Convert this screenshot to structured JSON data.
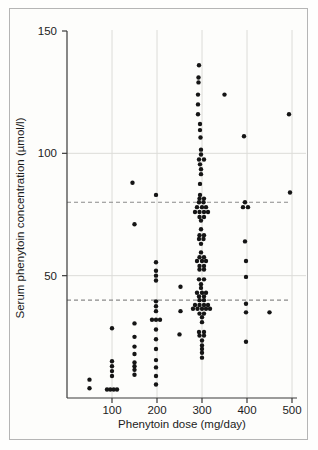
{
  "figure": {
    "background_color": "#fdfdfb",
    "frame_border_color": "#b5b5b5",
    "axis_color": "#3a3a3a",
    "gridline_color": "#dcdcd8",
    "reference_line_color": "#8a8a8a",
    "point_color": "#151515"
  },
  "chart_data": {
    "type": "scatter",
    "title": "",
    "xlabel": "Phenytoin dose (mg/day)",
    "ylabel": "Serum phenytoin concentration (µmol/l)",
    "xlim": [
      0,
      520
    ],
    "ylim": [
      0,
      150
    ],
    "x_ticks": [
      100,
      200,
      300,
      400,
      500
    ],
    "y_ticks": [
      50,
      100,
      150
    ],
    "grid": {
      "vertical_at_x_ticks": true,
      "horizontal_at_y": [
        50,
        100
      ]
    },
    "reference_lines": {
      "style": "dashed",
      "orientation": "horizontal",
      "values": [
        40,
        80
      ],
      "meaning": "therapeutic range shown by dashed lines"
    },
    "legend": null,
    "series": [
      {
        "name": "patients",
        "marker": "filled-circle",
        "points": [
          [
            50,
            7.5
          ],
          [
            50,
            4
          ],
          [
            100,
            28.5
          ],
          [
            100,
            15
          ],
          [
            100,
            13
          ],
          [
            100,
            11
          ],
          [
            100,
            9
          ],
          [
            100,
            3.5,
            -5
          ],
          [
            100,
            3.5,
            -1.7
          ],
          [
            100,
            3.5,
            1.7
          ],
          [
            100,
            3.5,
            5
          ],
          [
            150,
            88,
            -2
          ],
          [
            150,
            71
          ],
          [
            150,
            30.5
          ],
          [
            150,
            25
          ],
          [
            150,
            21
          ],
          [
            150,
            18
          ],
          [
            150,
            14.5
          ],
          [
            150,
            13
          ],
          [
            150,
            11.5
          ],
          [
            150,
            9.5
          ],
          [
            200,
            83,
            -1
          ],
          [
            200,
            55.5,
            -1
          ],
          [
            200,
            52,
            -1
          ],
          [
            200,
            50,
            -1
          ],
          [
            200,
            48,
            -1
          ],
          [
            200,
            39.5,
            -1
          ],
          [
            200,
            37.5,
            -1
          ],
          [
            200,
            35.5,
            -1
          ],
          [
            200,
            32,
            -5
          ],
          [
            200,
            32,
            -1
          ],
          [
            200,
            32,
            3
          ],
          [
            200,
            28,
            -1
          ],
          [
            200,
            24,
            -1
          ],
          [
            200,
            20,
            -1
          ],
          [
            200,
            15.5,
            -1
          ],
          [
            200,
            12.5,
            -1
          ],
          [
            200,
            9,
            -1
          ],
          [
            200,
            5.5,
            -1
          ],
          [
            250,
            45.5,
            1
          ],
          [
            250,
            35.5,
            1
          ],
          [
            250,
            26
          ],
          [
            300,
            136,
            -3
          ],
          [
            300,
            131,
            -3.5
          ],
          [
            300,
            129,
            -3.5
          ],
          [
            300,
            124,
            -4
          ],
          [
            300,
            120,
            -4
          ],
          [
            300,
            116,
            -4
          ],
          [
            300,
            112,
            -2
          ],
          [
            300,
            109.5,
            -2
          ],
          [
            300,
            106.5,
            -1.5
          ],
          [
            300,
            101.5,
            -1
          ],
          [
            300,
            99.5,
            -1
          ],
          [
            300,
            97.5,
            -3
          ],
          [
            300,
            97.5,
            2
          ],
          [
            300,
            95.5,
            -2
          ],
          [
            300,
            93.5,
            -1
          ],
          [
            300,
            91.5,
            -1
          ],
          [
            300,
            87.5,
            -2
          ],
          [
            300,
            83,
            -2
          ],
          [
            300,
            81.5,
            -2.5
          ],
          [
            300,
            81.5,
            2
          ],
          [
            300,
            80,
            -3
          ],
          [
            300,
            80,
            1.5
          ],
          [
            300,
            78,
            -5
          ],
          [
            300,
            78,
            0
          ],
          [
            300,
            78,
            4
          ],
          [
            300,
            76,
            -7
          ],
          [
            300,
            76,
            -2.5
          ],
          [
            300,
            76,
            2
          ],
          [
            300,
            76,
            6
          ],
          [
            300,
            74,
            -2.5
          ],
          [
            300,
            74,
            2
          ],
          [
            300,
            72.5,
            -1
          ],
          [
            300,
            69,
            -1
          ],
          [
            300,
            66.5,
            -2.5
          ],
          [
            300,
            66.5,
            2
          ],
          [
            300,
            65,
            -3
          ],
          [
            300,
            65,
            1.5
          ],
          [
            300,
            63,
            -1
          ],
          [
            300,
            59.5,
            -1
          ],
          [
            300,
            57.5,
            -2.5
          ],
          [
            300,
            57.5,
            2
          ],
          [
            300,
            56,
            -5
          ],
          [
            300,
            56,
            0
          ],
          [
            300,
            56,
            4
          ],
          [
            300,
            54,
            -2.5
          ],
          [
            300,
            54,
            2
          ],
          [
            300,
            52.5,
            -2.5
          ],
          [
            300,
            52.5,
            2
          ],
          [
            300,
            48.5,
            -3
          ],
          [
            300,
            48.5,
            2
          ],
          [
            300,
            46.5,
            -1
          ],
          [
            300,
            45,
            -1
          ],
          [
            300,
            43,
            -5
          ],
          [
            300,
            43,
            0
          ],
          [
            300,
            43,
            4
          ],
          [
            300,
            41.5,
            -3
          ],
          [
            300,
            41.5,
            2
          ],
          [
            300,
            40,
            -2.5
          ],
          [
            300,
            40,
            2
          ],
          [
            300,
            38,
            -7
          ],
          [
            300,
            38,
            -2.5
          ],
          [
            300,
            38,
            2
          ],
          [
            300,
            38,
            6
          ],
          [
            300,
            36.5,
            -9
          ],
          [
            300,
            36.5,
            -4.5
          ],
          [
            300,
            36.5,
            0
          ],
          [
            300,
            36.5,
            4
          ],
          [
            300,
            36.5,
            8
          ],
          [
            300,
            34.5,
            -2.5
          ],
          [
            300,
            34.5,
            2
          ],
          [
            300,
            33,
            0
          ],
          [
            300,
            31,
            0
          ],
          [
            300,
            27,
            -3
          ],
          [
            300,
            27,
            2
          ],
          [
            300,
            25.5,
            -2.5
          ],
          [
            300,
            25.5,
            2
          ],
          [
            300,
            23.5,
            0
          ],
          [
            300,
            21.5,
            0
          ],
          [
            300,
            20,
            0
          ],
          [
            300,
            18.5,
            0
          ],
          [
            300,
            16.5,
            0
          ],
          [
            350,
            124
          ],
          [
            400,
            107,
            -3
          ],
          [
            400,
            80,
            -2
          ],
          [
            400,
            78,
            -4
          ],
          [
            400,
            78,
            1
          ],
          [
            400,
            64,
            -2
          ],
          [
            400,
            56,
            -1
          ],
          [
            400,
            49.5,
            -1
          ],
          [
            400,
            38.5,
            -1
          ],
          [
            400,
            35,
            -1
          ],
          [
            400,
            23,
            -1
          ],
          [
            450,
            35
          ],
          [
            500,
            116,
            -3
          ],
          [
            500,
            84,
            -2
          ]
        ]
      }
    ]
  }
}
